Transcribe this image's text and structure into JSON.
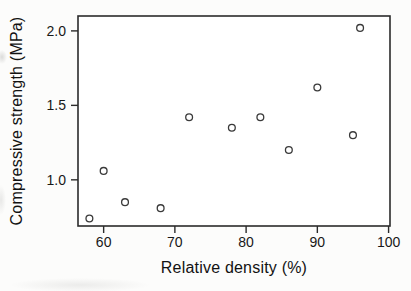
{
  "chart_data": {
    "type": "scatter",
    "title": "",
    "xlabel": "Relative density (%)",
    "ylabel": "Compressive strength (MPa)",
    "x_ticks": [
      60,
      70,
      80,
      90,
      100
    ],
    "x_tick_labels": [
      "60",
      "70",
      "80",
      "90",
      "100"
    ],
    "y_ticks": [
      1.0,
      1.5,
      2.0
    ],
    "y_tick_labels": [
      "1.0",
      "1.5",
      "2.0"
    ],
    "xlim": [
      56.4,
      100.2
    ],
    "ylim": [
      0.69,
      2.1
    ],
    "grid": false,
    "legend": "none",
    "marker": "open-circle",
    "axis_color": "#2b2b2b",
    "point_color": "#3a3a3a",
    "plot_bg": "#ffffff",
    "points": [
      [
        58,
        0.74
      ],
      [
        60,
        1.06
      ],
      [
        63,
        0.85
      ],
      [
        68,
        0.81
      ],
      [
        72,
        1.42
      ],
      [
        78,
        1.35
      ],
      [
        82,
        1.42
      ],
      [
        86,
        1.2
      ],
      [
        90,
        1.62
      ],
      [
        95,
        1.3
      ],
      [
        96,
        2.02
      ]
    ]
  }
}
